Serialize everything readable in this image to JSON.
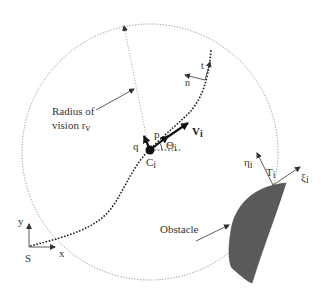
{
  "diagram": {
    "labels": {
      "radius": "Radius of",
      "radius2": "vision r",
      "radius_sub": "v",
      "t": "t",
      "n": "n",
      "p": "p",
      "q": "q",
      "v": "V",
      "v_sub": "i",
      "theta": "Θ",
      "theta_sub": "i",
      "c": "C",
      "c_sub": "i",
      "eta": "η",
      "eta_sub": "i",
      "tt": "T",
      "tt_sub": "i",
      "xi": "ξ",
      "xi_sub": "i",
      "obstacle": "Obstacle",
      "y": "y",
      "x": "x",
      "s": "S"
    },
    "colors": {
      "obstacle_fill": "#5a5a5a",
      "line": "#333333",
      "circle": "#777777"
    }
  }
}
